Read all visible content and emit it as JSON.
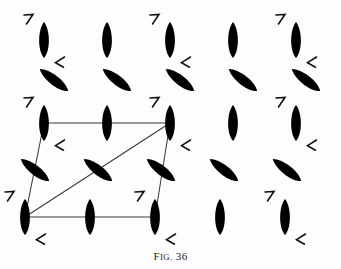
{
  "figure": {
    "caption_prefix": "F",
    "caption_smallcaps": "IG.",
    "caption_number": "36",
    "caption_full": "FIG. 36",
    "background_color": "#fdfdfd",
    "ink_color": "#000000",
    "line_color": "#3a3a3a",
    "width": 341,
    "height": 269
  },
  "chart_data": {
    "type": "scatter",
    "title": "FIG. 36",
    "xlabel": "",
    "ylabel": "",
    "xlim": [
      0,
      341
    ],
    "ylim": [
      0,
      269
    ],
    "grid": false,
    "legend": "none",
    "columns_x": [
      44,
      107,
      170,
      233,
      296
    ],
    "rows_y": [
      40,
      80,
      123,
      170,
      217
    ],
    "motif_symbol": "lens",
    "mark_upper": "7",
    "mark_lower": "L",
    "series": [
      {
        "name": "vertical-lens-motifs",
        "rotation_deg": 0,
        "points": [
          {
            "x": 44,
            "y": 40,
            "marks": true
          },
          {
            "x": 107,
            "y": 40,
            "marks": false
          },
          {
            "x": 170,
            "y": 40,
            "marks": true
          },
          {
            "x": 233,
            "y": 40,
            "marks": false
          },
          {
            "x": 296,
            "y": 40,
            "marks": true
          },
          {
            "x": 44,
            "y": 123,
            "marks": true
          },
          {
            "x": 107,
            "y": 123,
            "marks": false
          },
          {
            "x": 170,
            "y": 123,
            "marks": true
          },
          {
            "x": 233,
            "y": 123,
            "marks": false
          },
          {
            "x": 296,
            "y": 123,
            "marks": true
          },
          {
            "x": 25,
            "y": 217,
            "marks": true
          },
          {
            "x": 90,
            "y": 217,
            "marks": false
          },
          {
            "x": 155,
            "y": 217,
            "marks": true
          },
          {
            "x": 220,
            "y": 217,
            "marks": false
          },
          {
            "x": 285,
            "y": 217,
            "marks": true
          }
        ]
      },
      {
        "name": "tilted-lens-motifs",
        "rotation_deg": -52,
        "points": [
          {
            "x": 54,
            "y": 80,
            "marks": false
          },
          {
            "x": 117,
            "y": 80,
            "marks": false
          },
          {
            "x": 180,
            "y": 80,
            "marks": false
          },
          {
            "x": 243,
            "y": 80,
            "marks": false
          },
          {
            "x": 306,
            "y": 80,
            "marks": false
          },
          {
            "x": 35,
            "y": 170,
            "marks": false
          },
          {
            "x": 98,
            "y": 170,
            "marks": false
          },
          {
            "x": 161,
            "y": 170,
            "marks": false
          },
          {
            "x": 224,
            "y": 170,
            "marks": false
          },
          {
            "x": 287,
            "y": 170,
            "marks": false
          }
        ]
      }
    ],
    "unit_cell": {
      "name": "unit-cell-parallelogram",
      "vertices": [
        {
          "x": 44,
          "y": 123
        },
        {
          "x": 170,
          "y": 123
        },
        {
          "x": 155,
          "y": 217
        },
        {
          "x": 25,
          "y": 217
        }
      ],
      "diagonal": [
        {
          "x": 25,
          "y": 217
        },
        {
          "x": 170,
          "y": 123
        }
      ]
    }
  }
}
